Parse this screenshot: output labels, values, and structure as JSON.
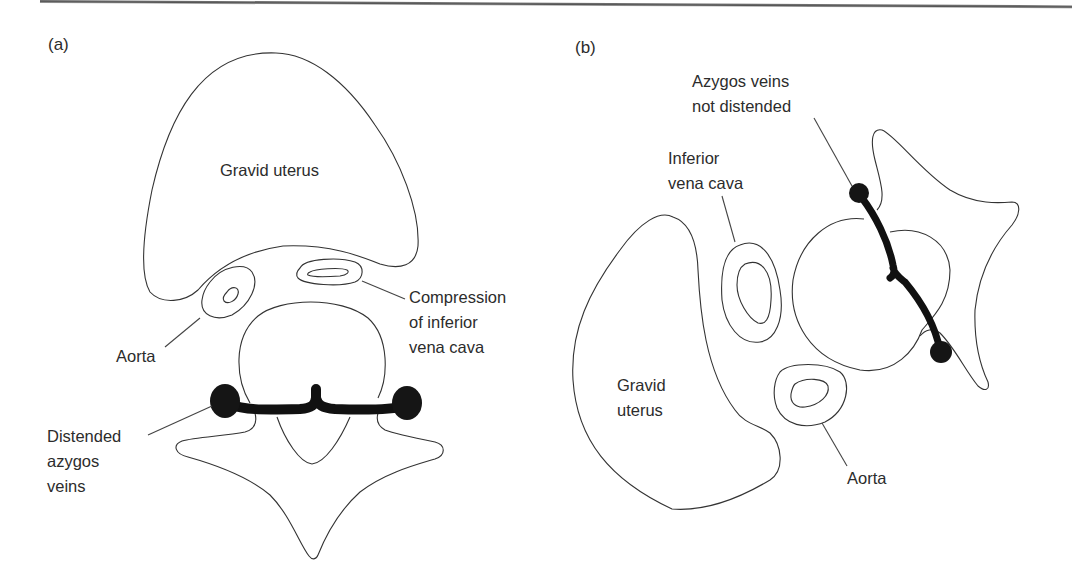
{
  "figure": {
    "panels": [
      {
        "id": "a",
        "label": "(a)",
        "structures": {
          "uterus": "Gravid uterus",
          "aorta": "Aorta",
          "ivc": [
            "Compression",
            "of inferior",
            "vena cava"
          ],
          "azygos": [
            "Distended",
            "azygos",
            "veins"
          ]
        }
      },
      {
        "id": "b",
        "label": "(b)",
        "structures": {
          "uterus": [
            "Gravid",
            "uterus"
          ],
          "aorta": "Aorta",
          "ivc": [
            "Inferior",
            "vena cava"
          ],
          "azygos": [
            "Azygos veins",
            "not distended"
          ]
        }
      }
    ],
    "colors": {
      "outline": "#333333",
      "vein_fill": "#151515",
      "text": "#2c2c2c",
      "background": "#ffffff"
    }
  }
}
